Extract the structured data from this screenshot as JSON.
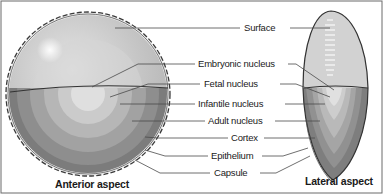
{
  "diagram": {
    "views": {
      "anterior": {
        "caption": "Anterior aspect"
      },
      "lateral": {
        "caption": "Lateral aspect"
      }
    },
    "labels": [
      {
        "id": "surface",
        "text": "Surface"
      },
      {
        "id": "embryonic_nucleus",
        "text": "Embryonic nucleus"
      },
      {
        "id": "fetal_nucleus",
        "text": "Fetal nucleus"
      },
      {
        "id": "infantile_nucleus",
        "text": "Infantile nucleus"
      },
      {
        "id": "adult_nucleus",
        "text": "Adult nucleus"
      },
      {
        "id": "cortex",
        "text": "Cortex"
      },
      {
        "id": "epithelium",
        "text": "Epithelium"
      },
      {
        "id": "capsule",
        "text": "Capsule"
      }
    ],
    "colors": {
      "surface": "#c9c9c9",
      "embryonic": "#dedede",
      "fetal": "#cdcdcd",
      "infantile": "#b8b8b8",
      "adult": "#a2a2a2",
      "cortex": "#8a8a8a",
      "outline": "#3a3a3a",
      "leader": "#4a4a4a"
    }
  }
}
